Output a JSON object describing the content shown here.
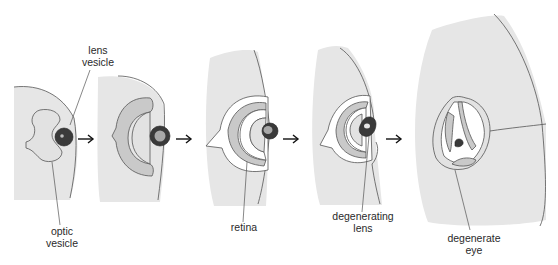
{
  "figure": {
    "stages": [
      {
        "id": 1,
        "labels": [
          "lens vesicle",
          "optic vesicle"
        ]
      },
      {
        "id": 2,
        "labels": []
      },
      {
        "id": 3,
        "labels": [
          "retina"
        ]
      },
      {
        "id": 4,
        "labels": [
          "degenerating lens"
        ]
      },
      {
        "id": 5,
        "labels": [
          "degenerate eye"
        ]
      }
    ],
    "arrow_count": 4
  },
  "labels": {
    "lens_vesicle": "lens\nvesicle",
    "optic_vesicle": "optic\nvesicle",
    "retina": "retina",
    "degenerating_lens": "degenerating\nlens",
    "degenerate_eye": "degenerate\neye"
  },
  "colors": {
    "tissue": "#e6e6e6",
    "layer": "#c9c9c9",
    "lens_dark": "#3a3a3a",
    "outline": "#555555",
    "arrow": "#111111"
  }
}
